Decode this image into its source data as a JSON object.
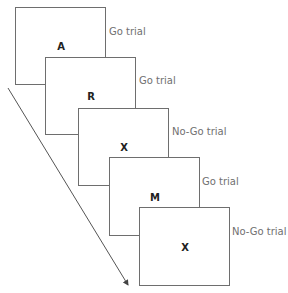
{
  "diagram": {
    "title": "",
    "trials": [
      {
        "stimulus": "A",
        "label": "Go trial"
      },
      {
        "stimulus": "R",
        "label": "Go trial"
      },
      {
        "stimulus": "X",
        "label": "No-Go trial"
      },
      {
        "stimulus": "M",
        "label": "Go trial"
      },
      {
        "stimulus": "X",
        "label": "No-Go trial"
      }
    ],
    "arrow": "time-arrow"
  }
}
